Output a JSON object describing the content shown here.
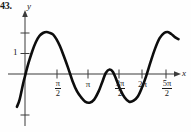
{
  "figure": {
    "problem_number": "43.",
    "background_color": "#fefefe",
    "curve_color": "#0d0d0d",
    "axis_color": "#3b3b3b"
  },
  "axes": {
    "y_axis_label": "y",
    "x_axis_label": "x",
    "y_tick_labels": [
      "1"
    ],
    "x_tick_labels": [
      {
        "kind": "fraction",
        "numerator": "π",
        "denominator": "2",
        "value_label": "π/2"
      },
      {
        "kind": "plain",
        "text": "π",
        "value_label": "π"
      },
      {
        "kind": "fraction",
        "numerator": "3π",
        "denominator": "2",
        "value_label": "3π/2"
      },
      {
        "kind": "plain",
        "text": "2π",
        "value_label": "2π"
      },
      {
        "kind": "fraction",
        "numerator": "5π",
        "denominator": "2",
        "value_label": "5π/2"
      }
    ]
  },
  "chart_data": {
    "type": "line",
    "title": "",
    "xlabel": "x",
    "ylabel": "y",
    "grid": false,
    "legend": null,
    "xlim": [
      -0.45,
      8.55
    ],
    "ylim": [
      -2.0,
      2.6
    ],
    "xticks": [
      1.5708,
      3.1416,
      4.7124,
      6.2832,
      7.854
    ],
    "xticklabels": [
      "π/2",
      "π",
      "3π/2",
      "2π",
      "5π/2"
    ],
    "yticks": [
      1
    ],
    "yticklabels": [
      "1"
    ],
    "annotations": [
      "43."
    ],
    "series": [
      {
        "name": "curve",
        "description": "Oscillating curve: large positive arch peaking near x = pi/2, dipping below axis after pi, a small low bump just crossing zero at 3pi/2, another dip, then rising to a large peak near 5pi/2 where the trace is cut off.",
        "x": [
          -0.45,
          -0.3,
          -0.1,
          0.0,
          0.2,
          0.4,
          0.6,
          0.8,
          1.0,
          1.2,
          1.4,
          1.5708,
          1.75,
          1.95,
          2.15,
          2.4,
          2.65,
          2.9,
          3.1416,
          3.35,
          3.6,
          3.85,
          4.1,
          4.3,
          4.5,
          4.7124,
          4.9,
          5.1,
          5.3,
          5.55,
          5.8,
          6.05,
          6.2832,
          6.5,
          6.75,
          7.0,
          7.25,
          7.5,
          7.75,
          7.95,
          8.15,
          8.35,
          8.55
        ],
        "y": [
          -1.6,
          -1.25,
          -0.45,
          -0.1,
          0.55,
          1.1,
          1.55,
          1.85,
          2.0,
          2.05,
          2.0,
          1.92,
          1.7,
          1.35,
          0.9,
          0.3,
          -0.35,
          -0.85,
          -1.15,
          -1.35,
          -1.4,
          -1.25,
          -0.85,
          -0.4,
          0.05,
          0.22,
          0.1,
          -0.3,
          -0.75,
          -1.15,
          -1.35,
          -1.3,
          -1.1,
          -0.7,
          -0.1,
          0.6,
          1.25,
          1.75,
          2.0,
          2.05,
          1.95,
          1.8,
          1.7
        ]
      }
    ]
  }
}
